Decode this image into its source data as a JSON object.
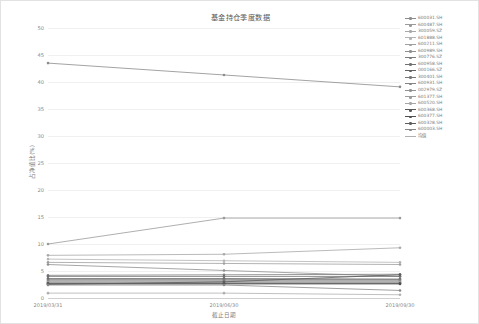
{
  "figure": {
    "title": "基金持仓季度数据",
    "background": "#ffffff",
    "border_color": "#e2e2e2"
  },
  "chart_data": {
    "type": "line",
    "title": "基金持仓季度数据",
    "xlabel": "截止日期",
    "ylabel": "占净值比(%)",
    "x": [
      "2019/03/31",
      "2019/06/30",
      "2019/09/30"
    ],
    "xtick_labels": [
      "2019/03/31",
      "2019/06/30",
      "2019/09/30"
    ],
    "ytick_labels": [
      "0",
      "5",
      "10",
      "15",
      "20",
      "25",
      "30",
      "35",
      "40",
      "45",
      "50"
    ],
    "ylim": [
      0,
      50
    ],
    "yticks": [
      0,
      5,
      10,
      15,
      20,
      25,
      30,
      35,
      40,
      45,
      50
    ],
    "grid": true,
    "legend_position": "right",
    "series": [
      {
        "name": "600031.SH",
        "color": "#8c8c8c",
        "values": [
          43.5,
          41.3,
          39.1
        ]
      },
      {
        "name": "600487.SH",
        "color": "#9a9a9a",
        "values": [
          10.0,
          14.8,
          14.8
        ]
      },
      {
        "name": "300059.SZ",
        "color": "#a8a8a8",
        "values": [
          7.9,
          8.1,
          9.3
        ]
      },
      {
        "name": "601888.SH",
        "color": "#b4b4b4",
        "values": [
          7.2,
          6.9,
          6.6
        ]
      },
      {
        "name": "600211.SH",
        "color": "#9f9f9f",
        "values": [
          6.6,
          6.4,
          6.2
        ]
      },
      {
        "name": "600989.SH",
        "color": "#8f8f8f",
        "values": [
          6.2,
          5.1,
          4.0
        ]
      },
      {
        "name": "300776.SZ",
        "color": "#7d7d7d",
        "values": [
          4.2,
          4.3,
          4.4
        ]
      },
      {
        "name": "600958.SH",
        "color": "#707070",
        "values": [
          4.0,
          4.0,
          4.0
        ]
      },
      {
        "name": "000166.SZ",
        "color": "#626262",
        "values": [
          3.6,
          3.6,
          3.5
        ]
      },
      {
        "name": "300401.SH",
        "color": "#767676",
        "values": [
          3.4,
          3.4,
          3.4
        ]
      },
      {
        "name": "600931.SH",
        "color": "#848484",
        "values": [
          3.2,
          3.2,
          3.2
        ]
      },
      {
        "name": "002979.SZ",
        "color": "#919191",
        "values": [
          3.0,
          3.0,
          3.0
        ]
      },
      {
        "name": "601377.SH",
        "color": "#9c9c9c",
        "values": [
          2.9,
          2.9,
          2.9
        ]
      },
      {
        "name": "600520.SH",
        "color": "#a6a6a6",
        "values": [
          2.8,
          2.8,
          2.8
        ]
      },
      {
        "name": "600368.SH",
        "color": "#585858",
        "values": [
          2.7,
          2.7,
          2.7
        ]
      },
      {
        "name": "600377.SH",
        "color": "#4f4f4f",
        "values": [
          2.6,
          2.6,
          2.6
        ]
      },
      {
        "name": "600328.SH",
        "color": "#5c5c5c",
        "values": [
          2.5,
          3.0,
          4.3
        ]
      },
      {
        "name": "600003.SH",
        "color": "#888888",
        "values": [
          2.4,
          2.4,
          1.4
        ]
      },
      {
        "name": "均值",
        "color": "#b0b0b0",
        "values": [
          0.9,
          0.9,
          0.6
        ]
      }
    ]
  }
}
